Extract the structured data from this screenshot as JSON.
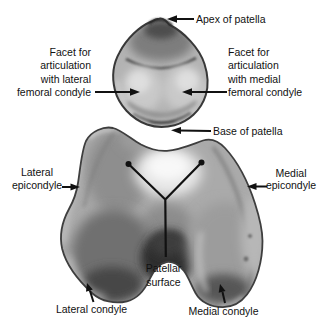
{
  "figure": {
    "palette": {
      "background": "#ffffff",
      "ink": "#111111",
      "bone_outline": "#3c3c3c",
      "bone_mid_gray": "#aaaaaa",
      "bone_light_gray": "#e8e8e8",
      "bone_dark_gray": "#2d2d2d"
    },
    "labels": {
      "apex": {
        "text": "Apex of patella"
      },
      "facet_lateral": {
        "lines": [
          "Facet for",
          "articulation",
          "with lateral",
          "femoral condyle"
        ]
      },
      "facet_medial": {
        "lines": [
          "Facet for",
          "articulation",
          "with medial",
          "femoral condyle"
        ]
      },
      "base": {
        "text": "Base of patella"
      },
      "lateral_epicondyle": {
        "lines": [
          "Lateral",
          "epicondyle"
        ]
      },
      "medial_epicondyle": {
        "lines": [
          "Medial",
          "epicondyle"
        ]
      },
      "patellar_surface": {
        "lines": [
          "Patellar",
          "surface"
        ]
      },
      "lateral_condyle": {
        "text": "Lateral condyle"
      },
      "medial_condyle": {
        "text": "Medial condyle"
      }
    }
  }
}
